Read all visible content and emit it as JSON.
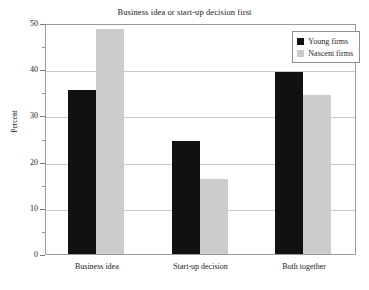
{
  "chart_data": {
    "type": "bar",
    "title": "Business idea or start-up decision first",
    "xlabel": "",
    "ylabel": "Percent",
    "categories": [
      "Business idea",
      "Start-up decision",
      "Both together"
    ],
    "series": [
      {
        "name": "Young firms",
        "color": "#111111",
        "values": [
          35.4,
          24.5,
          39.5
        ]
      },
      {
        "name": "Nascent firms",
        "color": "#cccccc",
        "values": [
          48.6,
          16.2,
          34.5
        ]
      }
    ],
    "ylim": [
      0,
      50
    ],
    "yticks": [
      0,
      10,
      20,
      30,
      40,
      50
    ],
    "ytick_labels": [
      "0",
      "10",
      "20",
      "30",
      "40",
      "50"
    ],
    "yminor_ticks": [
      5,
      15,
      25,
      35,
      45
    ],
    "grid": "horizontal-major",
    "legend_position": "top-right"
  },
  "legend": {
    "entries": [
      {
        "label": "Young firms",
        "swatch": "swatch-black"
      },
      {
        "label": "Nascent firms",
        "swatch": "swatch-gray"
      }
    ]
  }
}
